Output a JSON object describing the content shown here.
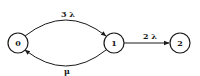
{
  "diagram": {
    "type": "state-transition",
    "nodes": [
      {
        "id": "0",
        "label": "0"
      },
      {
        "id": "1",
        "label": "1"
      },
      {
        "id": "2",
        "label": "2"
      }
    ],
    "edges": [
      {
        "from": "0",
        "to": "1",
        "label": "3 λ"
      },
      {
        "from": "1",
        "to": "0",
        "label": "μ"
      },
      {
        "from": "1",
        "to": "2",
        "label": "2 λ"
      }
    ]
  }
}
